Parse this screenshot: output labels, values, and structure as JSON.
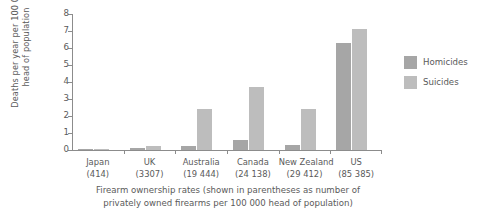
{
  "chart_data": {
    "type": "bar",
    "title": "",
    "xlabel": "Firearm ownership rates (shown in parentheses as number of privately owned firearms per 100 000 head of population)",
    "ylabel": "Deaths per year per 100 000 head of population",
    "ylim": [
      0,
      8
    ],
    "yticks": [
      0,
      1,
      2,
      3,
      4,
      5,
      6,
      7,
      8
    ],
    "grid": false,
    "legend_position": "right",
    "categories": [
      "Japan",
      "UK",
      "Australia",
      "Canada",
      "New Zealand",
      "US"
    ],
    "category_sublabels": [
      "(414)",
      "(3307)",
      "(19 444)",
      "(24 138)",
      "(29 412)",
      "(85 385)"
    ],
    "series": [
      {
        "name": "Homicides",
        "color": "#a6a6a6",
        "values": [
          0.04,
          0.1,
          0.25,
          0.6,
          0.3,
          6.3
        ]
      },
      {
        "name": "Suicides",
        "color": "#bdbdbd",
        "values": [
          0.06,
          0.25,
          2.4,
          3.7,
          2.4,
          7.1
        ]
      }
    ]
  },
  "axis": {
    "ylabel_line1": "Deaths per year per 100 000",
    "ylabel_line2": "head of population"
  },
  "caption": {
    "line1": "Firearm ownership rates (shown in parentheses as number of",
    "line2": "privately owned firearms per 100 000 head of population)"
  }
}
